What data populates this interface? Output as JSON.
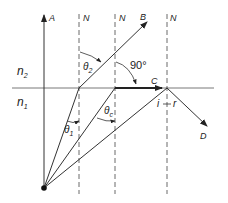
{
  "diagram": {
    "title": "",
    "media": {
      "upper": {
        "label": "n",
        "subscript": "2"
      },
      "lower": {
        "label": "n",
        "subscript": "1"
      }
    },
    "normals": [
      {
        "label": "N"
      },
      {
        "label": "N"
      },
      {
        "label": "N"
      }
    ],
    "rays": {
      "A": "A",
      "B": "B",
      "C": "C",
      "D": "D"
    },
    "angles": {
      "theta1": {
        "symbol": "θ",
        "subscript": "1"
      },
      "theta2": {
        "symbol": "θ",
        "subscript": "2"
      },
      "thetac": {
        "symbol": "θ",
        "subscript": "c"
      },
      "right_angle": "90°",
      "incidence": "i",
      "reflection": "r"
    },
    "colors": {
      "line": "#333333",
      "interface": "#555555",
      "background": "#ffffff"
    }
  }
}
